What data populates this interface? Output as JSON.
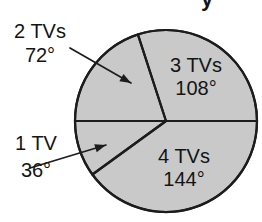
{
  "figure": {
    "background_color": "#ffffff",
    "title_fragment": "y",
    "title_note": "cropped at top edge"
  },
  "chart_data": {
    "type": "pie",
    "title": "",
    "xlabel": "",
    "ylabel": "",
    "legend_position": "none",
    "grid": false,
    "units": "degrees",
    "total_degrees": 360,
    "fill_color": "#c9c9c9",
    "outline_color": "#1c1c1c",
    "center": {
      "x": 166,
      "y": 121
    },
    "radius": 91,
    "categories": [
      "3 TVs",
      "2 TVs",
      "1 TV",
      "4 TVs"
    ],
    "values": [
      108,
      72,
      36,
      144
    ],
    "slices": [
      {
        "category": "3 TVs",
        "label_name": "3 TVs",
        "label_value": "108°",
        "degrees": 108,
        "start_angle": 0,
        "end_angle": 108,
        "label_placement": "inside",
        "label_x": 196,
        "label_y_name": 72,
        "label_y_value": 95
      },
      {
        "category": "2 TVs",
        "label_name": "2 TVs",
        "label_value": "72°",
        "degrees": 72,
        "start_angle": 108,
        "end_angle": 180,
        "label_placement": "outside-left",
        "label_x": 40,
        "label_y_name": 38,
        "label_y_value": 62,
        "leader": {
          "x1": 70,
          "y1": 48,
          "x2": 131,
          "y2": 83
        }
      },
      {
        "category": "1 TV",
        "label_name": "1 TV",
        "label_value": "36°",
        "degrees": 36,
        "start_angle": 180,
        "end_angle": 216,
        "label_placement": "outside-left",
        "label_x": 36,
        "label_y_name": 150,
        "label_y_value": 177,
        "leader": {
          "x1": 30,
          "y1": 168,
          "x2": 106,
          "y2": 145
        }
      },
      {
        "category": "4 TVs",
        "label_name": "4 TVs",
        "label_value": "144°",
        "degrees": 144,
        "start_angle": 216,
        "end_angle": 360,
        "label_placement": "inside",
        "label_x": 184,
        "label_y_name": 163,
        "label_y_value": 186
      }
    ]
  }
}
